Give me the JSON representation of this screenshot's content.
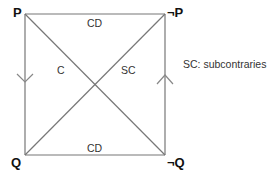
{
  "diagram": {
    "type": "square-of-opposition",
    "corners": {
      "top_left": "P",
      "top_right": "¬P",
      "bottom_left": "Q",
      "bottom_right": "¬Q"
    },
    "edges": {
      "top": "CD",
      "bottom": "CD",
      "diagonal_left": "C",
      "diagonal_right": "SC",
      "left_arrow": "down",
      "right_arrow": "up"
    },
    "legend": "SC: subcontraries",
    "colors": {
      "line": "#777777",
      "text": "#333333",
      "corner_text": "#111111"
    }
  }
}
